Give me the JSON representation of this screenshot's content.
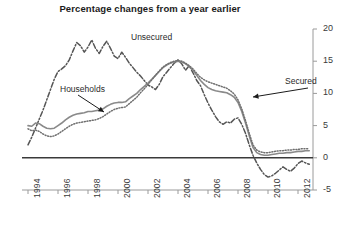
{
  "chart_data": {
    "type": "line",
    "title": "Percentage changes from a year earlier",
    "xlabel": "",
    "ylabel": "",
    "ylim": [
      -5,
      20
    ],
    "yticks": [
      -5,
      0,
      5,
      10,
      15,
      20
    ],
    "ytick_labels": [
      "-5",
      "0",
      "5",
      "10",
      "15",
      "20"
    ],
    "y_axis_position": "right",
    "xlim": [
      1993.6,
      2013.0
    ],
    "xticks": [
      1994,
      1996,
      1998,
      2000,
      2002,
      2004,
      2006,
      2008,
      2010,
      2012
    ],
    "xtick_labels": [
      "1994",
      "1996",
      "1998",
      "2000",
      "2002",
      "2004",
      "2006",
      "2008",
      "2010",
      "2012"
    ],
    "xtick_rotation": 90,
    "grid": false,
    "zero_line": true,
    "legend": "annotations",
    "annotations": [
      {
        "text": "Unsecured",
        "x_px": 131,
        "y_px": 32,
        "arrow": false
      },
      {
        "text": "Households",
        "x_px": 60,
        "y_px": 84,
        "arrow": true,
        "arrow_from_px": [
          78,
          95
        ],
        "arrow_to_px": [
          104,
          112
        ]
      },
      {
        "text": "Secured",
        "x_px": 285,
        "y_px": 76,
        "arrow": true,
        "arrow_from_px": [
          308,
          88
        ],
        "arrow_to_px": [
          253,
          97
        ]
      }
    ],
    "series": [
      {
        "name": "Unsecured",
        "style": "dash-dot",
        "color": "#555555",
        "x": [
          1994.0,
          1994.25,
          1994.5,
          1994.75,
          1995.0,
          1995.25,
          1995.5,
          1995.75,
          1996.0,
          1996.25,
          1996.5,
          1996.75,
          1997.0,
          1997.25,
          1997.5,
          1997.75,
          1998.0,
          1998.25,
          1998.5,
          1998.75,
          1999.0,
          1999.25,
          1999.5,
          1999.75,
          2000.0,
          2000.25,
          2000.5,
          2000.75,
          2001.0,
          2001.25,
          2001.5,
          2001.75,
          2002.0,
          2002.25,
          2002.5,
          2002.75,
          2003.0,
          2003.25,
          2003.5,
          2003.75,
          2004.0,
          2004.25,
          2004.5,
          2004.75,
          2005.0,
          2005.25,
          2005.5,
          2005.75,
          2006.0,
          2006.25,
          2006.5,
          2006.75,
          2007.0,
          2007.25,
          2007.5,
          2007.75,
          2008.0,
          2008.25,
          2008.5,
          2008.75,
          2009.0,
          2009.25,
          2009.5,
          2009.75,
          2010.0,
          2010.25,
          2010.5,
          2010.75,
          2011.0,
          2011.25,
          2011.5,
          2011.75,
          2012.0,
          2012.25,
          2012.5,
          2012.75
        ],
        "y": [
          2.0,
          3.2,
          4.6,
          6.0,
          7.4,
          9.0,
          10.6,
          12.2,
          13.4,
          13.8,
          14.3,
          15.2,
          16.6,
          17.9,
          17.4,
          16.4,
          17.2,
          18.3,
          17.0,
          16.2,
          17.3,
          18.1,
          17.0,
          15.8,
          15.4,
          16.4,
          15.6,
          14.7,
          14.0,
          13.3,
          12.7,
          12.0,
          11.3,
          11.0,
          10.6,
          11.4,
          12.6,
          13.3,
          14.0,
          14.7,
          15.2,
          14.6,
          13.6,
          14.3,
          13.2,
          12.0,
          11.2,
          9.8,
          8.5,
          7.4,
          6.4,
          5.6,
          5.2,
          5.6,
          5.4,
          6.0,
          6.2,
          5.2,
          3.8,
          2.0,
          0.4,
          -0.8,
          -1.8,
          -2.6,
          -3.0,
          -2.8,
          -2.4,
          -1.9,
          -1.4,
          -1.8,
          -2.1,
          -1.6,
          -0.9,
          -0.5,
          -0.8,
          -1.0
        ]
      },
      {
        "name": "Households",
        "style": "solid",
        "color": "#8a8a8a",
        "x": [
          1994.0,
          1994.25,
          1994.5,
          1994.75,
          1995.0,
          1995.25,
          1995.5,
          1995.75,
          1996.0,
          1996.25,
          1996.5,
          1996.75,
          1997.0,
          1997.25,
          1997.5,
          1997.75,
          1998.0,
          1998.25,
          1998.5,
          1998.75,
          1999.0,
          1999.25,
          1999.5,
          1999.75,
          2000.0,
          2000.25,
          2000.5,
          2000.75,
          2001.0,
          2001.25,
          2001.5,
          2001.75,
          2002.0,
          2002.25,
          2002.5,
          2002.75,
          2003.0,
          2003.25,
          2003.5,
          2003.75,
          2004.0,
          2004.25,
          2004.5,
          2004.75,
          2005.0,
          2005.25,
          2005.5,
          2005.75,
          2006.0,
          2006.25,
          2006.5,
          2006.75,
          2007.0,
          2007.25,
          2007.5,
          2007.75,
          2008.0,
          2008.25,
          2008.5,
          2008.75,
          2009.0,
          2009.25,
          2009.5,
          2009.75,
          2010.0,
          2010.25,
          2010.5,
          2010.75,
          2011.0,
          2011.25,
          2011.5,
          2011.75,
          2012.0,
          2012.25,
          2012.5,
          2012.75
        ],
        "y": [
          5.0,
          4.9,
          5.4,
          5.3,
          4.9,
          4.6,
          4.5,
          4.6,
          5.0,
          5.4,
          5.9,
          6.3,
          6.6,
          6.8,
          6.9,
          7.0,
          7.2,
          7.2,
          7.3,
          7.4,
          7.6,
          8.0,
          8.3,
          8.5,
          8.6,
          8.6,
          8.7,
          9.2,
          9.6,
          10.0,
          10.6,
          11.1,
          11.6,
          12.2,
          12.8,
          13.4,
          14.0,
          14.4,
          14.7,
          14.9,
          15.0,
          14.9,
          14.6,
          14.2,
          13.6,
          12.8,
          12.0,
          11.4,
          10.9,
          10.6,
          10.4,
          10.3,
          10.2,
          10.1,
          9.8,
          9.4,
          8.6,
          7.2,
          5.4,
          3.4,
          1.6,
          0.8,
          0.5,
          0.4,
          0.4,
          0.5,
          0.6,
          0.7,
          0.7,
          0.8,
          0.8,
          0.9,
          1.0,
          1.0,
          1.1,
          1.1
        ]
      },
      {
        "name": "Secured",
        "style": "dotted",
        "color": "#6f6f6f",
        "x": [
          1994.0,
          1994.25,
          1994.5,
          1994.75,
          1995.0,
          1995.25,
          1995.5,
          1995.75,
          1996.0,
          1996.25,
          1996.5,
          1996.75,
          1997.0,
          1997.25,
          1997.5,
          1997.75,
          1998.0,
          1998.25,
          1998.5,
          1998.75,
          1999.0,
          1999.25,
          1999.5,
          1999.75,
          2000.0,
          2000.25,
          2000.5,
          2000.75,
          2001.0,
          2001.25,
          2001.5,
          2001.75,
          2002.0,
          2002.25,
          2002.5,
          2002.75,
          2003.0,
          2003.25,
          2003.5,
          2003.75,
          2004.0,
          2004.25,
          2004.5,
          2004.75,
          2005.0,
          2005.25,
          2005.5,
          2005.75,
          2006.0,
          2006.25,
          2006.5,
          2006.75,
          2007.0,
          2007.25,
          2007.5,
          2007.75,
          2008.0,
          2008.25,
          2008.5,
          2008.75,
          2009.0,
          2009.25,
          2009.5,
          2009.75,
          2010.0,
          2010.25,
          2010.5,
          2010.75,
          2011.0,
          2011.25,
          2011.5,
          2011.75,
          2012.0,
          2012.25,
          2012.5,
          2012.75
        ],
        "y": [
          4.5,
          4.2,
          4.3,
          4.1,
          3.7,
          3.4,
          3.3,
          3.4,
          3.7,
          4.1,
          4.5,
          4.9,
          5.2,
          5.4,
          5.5,
          5.6,
          5.7,
          5.8,
          5.9,
          6.1,
          6.4,
          6.8,
          7.2,
          7.5,
          7.7,
          7.8,
          7.9,
          8.4,
          8.9,
          9.4,
          10.1,
          10.7,
          11.4,
          12.1,
          12.8,
          13.5,
          14.1,
          14.5,
          14.8,
          15.0,
          15.1,
          15.0,
          14.7,
          14.3,
          13.8,
          13.1,
          12.5,
          12.1,
          11.8,
          11.6,
          11.4,
          11.2,
          11.0,
          10.8,
          10.4,
          9.9,
          9.0,
          7.6,
          5.8,
          3.8,
          2.0,
          1.2,
          0.9,
          0.8,
          0.8,
          0.9,
          1.0,
          1.1,
          1.1,
          1.2,
          1.2,
          1.3,
          1.3,
          1.4,
          1.4,
          1.4
        ]
      }
    ]
  },
  "axes": {
    "title": "Percentage changes from a year earlier"
  }
}
